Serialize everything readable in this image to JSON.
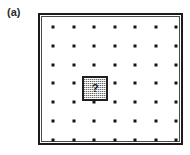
{
  "figure": {
    "panel_label": "(a)",
    "defect_label": "?",
    "colors": {
      "background": "#ffffff",
      "border": "#1c1c1c",
      "inner_rule": "#4a4a4a",
      "dot": "#141414",
      "defect_fill": "#c9c9c9",
      "defect_border": "#1f1f1f",
      "label_text": "#2b2b2b"
    }
  },
  "chart_data": {
    "type": "scatter",
    "title": "(a)",
    "xlabel": "",
    "ylabel": "",
    "grid": false,
    "legend": null,
    "lattice": {
      "rows": 7,
      "columns": 7,
      "x_spacing": 20.5,
      "y_spacing": 18.8,
      "x_origin": 13,
      "y_origin": 12,
      "dot_size": 3
    },
    "frame": {
      "x": 38,
      "y": 13,
      "width": 145,
      "height": 132,
      "outer_line_width": 2,
      "inner_line_width": 1
    },
    "x": [
      1,
      2,
      3,
      4,
      5,
      6,
      7
    ],
    "y": [
      1,
      2,
      3,
      4,
      5,
      6,
      7
    ],
    "missing_site": {
      "row": 4,
      "column": 3,
      "marker": "?",
      "x": 80,
      "y": 74,
      "width": 26,
      "height": 25
    },
    "annotations": [
      {
        "text": "(a)",
        "x": 7,
        "y": 6
      },
      {
        "text": "?",
        "x": 93,
        "y": 86
      }
    ]
  }
}
